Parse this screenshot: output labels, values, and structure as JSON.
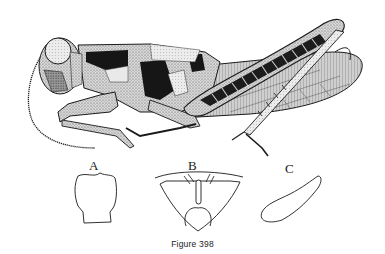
{
  "figure": {
    "caption": "Figure 398",
    "main_illustration": "grasshopper-lateral-view",
    "panels": [
      {
        "label": "A",
        "subject": "pronotum-dorsal-outline"
      },
      {
        "label": "B",
        "subject": "sternum-ventral-outline"
      },
      {
        "label": "C",
        "subject": "elongate-structure-outline"
      }
    ]
  },
  "colors": {
    "ink": "#1a1a1a",
    "background": "#ffffff",
    "stipple_mid": "#6e6e6e",
    "stipple_light": "#bdbdbd"
  }
}
